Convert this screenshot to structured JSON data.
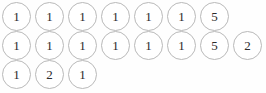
{
  "figure": {
    "type": "circle-token-grid",
    "background_color": "#fefefe",
    "circle_border_color": "#b9b9b9",
    "circle_fill_color": "#ffffff",
    "text_color": "#2b2b2b",
    "circle_diameter_px": 29,
    "row_count": 3,
    "rows": [
      {
        "index": 0,
        "count": 7,
        "values": [
          "1",
          "1",
          "1",
          "1",
          "1",
          "1",
          "5"
        ]
      },
      {
        "index": 1,
        "count": 8,
        "values": [
          "1",
          "1",
          "1",
          "1",
          "1",
          "1",
          "5",
          "2"
        ]
      },
      {
        "index": 2,
        "count": 3,
        "values": [
          "1",
          "2",
          "1"
        ]
      }
    ]
  }
}
